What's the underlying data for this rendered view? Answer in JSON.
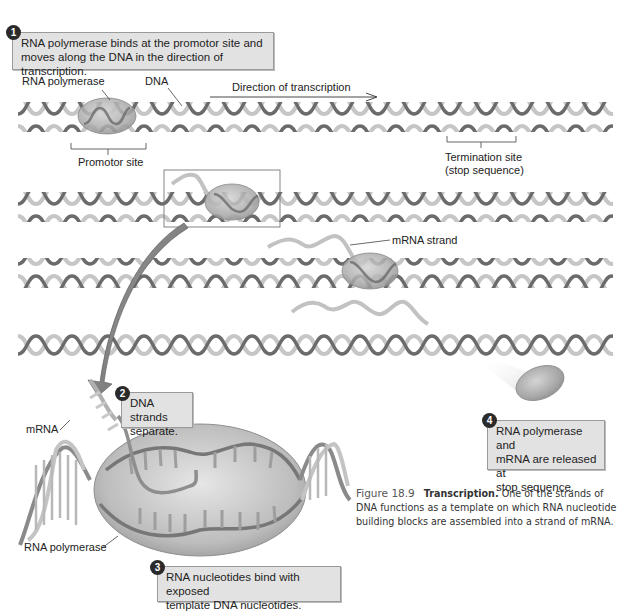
{
  "steps": [
    {
      "number": "1",
      "text_lines": [
        "RNA polymerase binds at the promotor site and",
        "moves along the DNA in the direction of transcription."
      ]
    },
    {
      "number": "2",
      "text_lines": [
        "DNA strands",
        "separate."
      ]
    },
    {
      "number": "3",
      "text_lines": [
        "RNA nucleotides bind with exposed",
        "template DNA nucleotides."
      ]
    },
    {
      "number": "4",
      "text_lines": [
        "RNA polymerase and",
        "mRNA are released at",
        "stop sequence."
      ]
    }
  ],
  "labels": {
    "rna_polymerase_top": "RNA polymerase",
    "dna": "DNA",
    "direction": "Direction of transcription",
    "promotor_site": "Promotor site",
    "termination_site": "Termination site",
    "stop_sequence": "(stop sequence)",
    "mrna_strand": "mRNA strand",
    "mrna_detail": "mRNA",
    "rna_polymerase_detail": "RNA polymerase"
  },
  "caption": {
    "figure_number": "Figure 18.9",
    "title": "Transcription.",
    "text": "One of the strands of DNA functions as a template on which RNA nucleotide building blocks are assembled into a strand of mRNA."
  },
  "colors": {
    "callout_bg": "#e2e2e2",
    "callout_border": "#9a9a9a",
    "badge_bg": "#2a2a2a",
    "helix_dark": "#6a6a6a",
    "helix_light": "#c4c4c4",
    "polymerase": "#a9a9a9",
    "arrow": "#7a7a7a"
  }
}
